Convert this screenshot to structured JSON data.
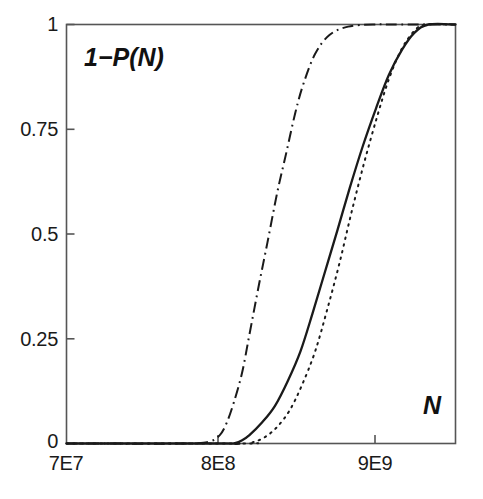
{
  "figure": {
    "background_color": "#ffffff",
    "axis_color": "#4d4d4d",
    "line_color": "#1a1a1a",
    "ylabel_text": "1−P(N)",
    "xlabel_text": "N"
  },
  "chart_data": {
    "type": "line",
    "title": "",
    "subtitle": "",
    "xlabel": "N",
    "ylabel": "1−P(N)",
    "xscale": "log",
    "yscale": "linear",
    "grid": false,
    "legend": "none",
    "xlim": [
      70000000,
      20000000000
    ],
    "ylim": [
      0,
      1
    ],
    "xtick_labels": [
      "7E7",
      "8E8",
      "9E9"
    ],
    "xtick_values": [
      70000000,
      800000000,
      9000000000
    ],
    "ytick_labels": [
      "0",
      "0.25",
      "0.5",
      "0.75",
      "1"
    ],
    "ytick_values": [
      0,
      0.25,
      0.5,
      0.75,
      1
    ],
    "annotations": [
      {
        "text": "1−P(N)",
        "position": "inside-top-left"
      },
      {
        "text": "N",
        "position": "inside-bottom-right"
      }
    ],
    "series": [
      {
        "name": "dash-dot curve",
        "style": "dashdot",
        "color": "#1a1a1a",
        "x": [
          70000000,
          400000000,
          560000000,
          650000000,
          720000000,
          800000000,
          900000000,
          1000000000,
          1150000000,
          1300000000,
          1500000000,
          1700000000,
          1950000000,
          2200000000,
          2600000000,
          3200000000,
          4200000000,
          6000000000,
          9000000000,
          20000000000
        ],
        "y": [
          0.0,
          0.0,
          0.005,
          0.02,
          0.05,
          0.1,
          0.17,
          0.26,
          0.38,
          0.48,
          0.6,
          0.69,
          0.79,
          0.86,
          0.93,
          0.975,
          0.995,
          1.0,
          1.0,
          1.0
        ]
      },
      {
        "name": "solid curve",
        "style": "solid",
        "color": "#1a1a1a",
        "x": [
          70000000,
          700000000,
          800000000,
          900000000,
          1000000000,
          1200000000,
          1450000000,
          1750000000,
          2100000000,
          2500000000,
          3000000000,
          3600000000,
          4300000000,
          5200000000,
          6300000000,
          7600000000,
          9200000000,
          11000000000,
          13500000000,
          20000000000
        ],
        "y": [
          0.0,
          0.0,
          0.0,
          0.008,
          0.02,
          0.05,
          0.09,
          0.15,
          0.22,
          0.31,
          0.41,
          0.51,
          0.61,
          0.71,
          0.8,
          0.88,
          0.94,
          0.98,
          1.0,
          1.0
        ]
      },
      {
        "name": "dotted curve",
        "style": "dotted",
        "color": "#1a1a1a",
        "x": [
          70000000,
          900000000,
          1050000000,
          1250000000,
          1500000000,
          1800000000,
          2150000000,
          2600000000,
          3100000000,
          3700000000,
          4400000000,
          5300000000,
          6400000000,
          7600000000,
          9100000000,
          11000000000,
          13000000000,
          20000000000
        ],
        "y": [
          0.0,
          0.0,
          0.003,
          0.015,
          0.04,
          0.08,
          0.14,
          0.22,
          0.32,
          0.43,
          0.55,
          0.67,
          0.78,
          0.87,
          0.94,
          0.985,
          1.0,
          1.0
        ]
      }
    ]
  }
}
